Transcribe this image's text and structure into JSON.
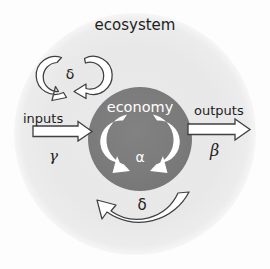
{
  "figure": {
    "type": "diagram",
    "outer_label": "ecosystem",
    "inner_label": "economy",
    "flows": {
      "input_label": "inputs",
      "input_symbol": "γ",
      "output_label": "outputs",
      "output_symbol": "β"
    },
    "cycles": {
      "internal_symbol": "α",
      "ecosystem_recycle_symbol": "δ",
      "ecosystem_return_symbol": "δ"
    },
    "colors": {
      "page_background": "#fdfdfd",
      "ecosystem_fill": "#e9e9e9",
      "economy_fill": "#7b7b7b",
      "arrow_fill": "#ffffff",
      "arrow_stroke": "#4a4a4a",
      "text_dark": "#1d1d1d",
      "text_light": "#ffffff"
    },
    "geometry": {
      "ecosystem_center_x": 135,
      "ecosystem_center_y": 134,
      "ecosystem_radius": 121,
      "economy_center_x": 140,
      "economy_center_y": 139,
      "economy_radius": 52
    }
  }
}
